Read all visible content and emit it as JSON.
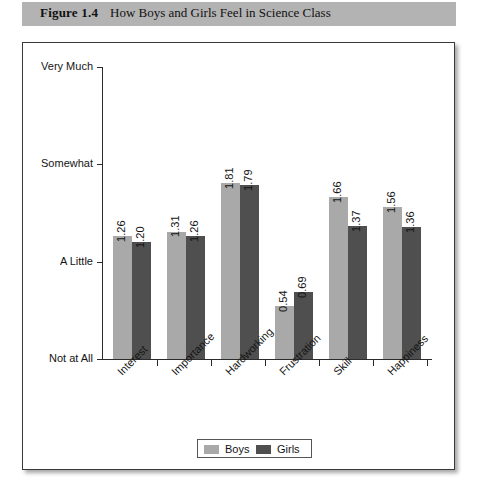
{
  "figure": {
    "number": "Figure 1.4",
    "caption": "How Boys and Girls Feel in Science Class"
  },
  "colors": {
    "boys": "#a9a9a9",
    "girls": "#4f4f4f",
    "header_band": "#b3b3b3",
    "axis": "#2b2b2b",
    "frame": "#3a3a3a"
  },
  "legend": {
    "position": "bottom-center",
    "entries": [
      {
        "label": "Boys",
        "color": "#a9a9a9"
      },
      {
        "label": "Girls",
        "color": "#4f4f4f"
      }
    ]
  },
  "chart_data": {
    "type": "bar",
    "title": "How Boys and Girls Feel in Science Class",
    "xlabel": "",
    "ylabel": "",
    "grid": false,
    "legend_position": "bottom-center",
    "categories": [
      "Interest",
      "Importance",
      "Hardworking",
      "Frustration",
      "Skill",
      "Happiness"
    ],
    "series": [
      {
        "name": "Boys",
        "color": "#a9a9a9",
        "values": [
          1.26,
          1.31,
          1.81,
          0.54,
          1.66,
          1.56
        ]
      },
      {
        "name": "Girls",
        "color": "#4f4f4f",
        "values": [
          1.2,
          1.26,
          1.79,
          0.69,
          1.37,
          1.36
        ]
      }
    ],
    "ylim": [
      0,
      3
    ],
    "ytick_values": [
      0,
      1,
      2,
      3
    ],
    "ytick_labels": [
      "Not at All",
      "A Little",
      "Somewhat",
      "Very Much"
    ],
    "value_labels": [
      "1.26",
      "1.20",
      "1.31",
      "1.26",
      "1.81",
      "1.79",
      "0.54",
      "0.69",
      "1.66",
      "1.37",
      "1.56",
      "1.36"
    ]
  }
}
